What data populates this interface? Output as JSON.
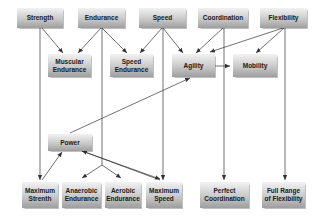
{
  "diagram": {
    "top_row": [
      {
        "id": "strength",
        "label": "Strength"
      },
      {
        "id": "endurance",
        "label": "Endurance"
      },
      {
        "id": "speed",
        "label": "Speed"
      },
      {
        "id": "coordination",
        "label": "Coordination"
      },
      {
        "id": "flexibility",
        "label": "Flexibility"
      }
    ],
    "middle_row": [
      {
        "id": "muscular-endurance",
        "label": "Muscular\nEndurance"
      },
      {
        "id": "speed-endurance",
        "label": "Speed\nEndurance"
      },
      {
        "id": "agility",
        "label": "Agility"
      },
      {
        "id": "mobility",
        "label": "Mobility"
      }
    ],
    "power": {
      "id": "power",
      "label": "Power"
    },
    "bottom_row": [
      {
        "id": "maximum-strenth",
        "label": "Maximum\nStrenth"
      },
      {
        "id": "anaerobic-endurance",
        "label": "Anaerobic\nEndurance"
      },
      {
        "id": "aerobic-endurance",
        "label": "Aerobic\nEndurance"
      },
      {
        "id": "maximum-speed",
        "label": "Maximum\nSpeed"
      },
      {
        "id": "perfect-coordination",
        "label": "Perfect\nCoordination"
      },
      {
        "id": "full-range-of-flexibility",
        "label": "Full Range\nof Flexibility"
      }
    ],
    "edges": [
      {
        "from": "Strength",
        "to": "Muscular Endurance"
      },
      {
        "from": "Strength",
        "to": "Maximum Strenth"
      },
      {
        "from": "Endurance",
        "to": "Muscular Endurance"
      },
      {
        "from": "Endurance",
        "to": "Speed Endurance"
      },
      {
        "from": "Endurance",
        "to": "Anaerobic Endurance"
      },
      {
        "from": "Endurance",
        "to": "Aerobic Endurance"
      },
      {
        "from": "Speed",
        "to": "Speed Endurance"
      },
      {
        "from": "Speed",
        "to": "Agility"
      },
      {
        "from": "Speed",
        "to": "Maximum Speed"
      },
      {
        "from": "Coordination",
        "to": "Agility"
      },
      {
        "from": "Coordination",
        "to": "Perfect Coordination"
      },
      {
        "from": "Flexibility",
        "to": "Agility"
      },
      {
        "from": "Flexibility",
        "to": "Mobility"
      },
      {
        "from": "Flexibility",
        "to": "Full Range of Flexibility"
      },
      {
        "from": "Agility",
        "to": "Mobility"
      },
      {
        "from": "Power",
        "to": "Agility"
      },
      {
        "from": "Maximum Strenth",
        "to": "Power"
      },
      {
        "from": "Maximum Speed",
        "to": "Power"
      },
      {
        "from": "Power",
        "to": "Maximum Speed"
      }
    ],
    "colors": {
      "box_top": "#f2f2f2",
      "box_bottom": "#9e9e9e",
      "line": "#333333",
      "text": "#1a1a1a"
    }
  }
}
